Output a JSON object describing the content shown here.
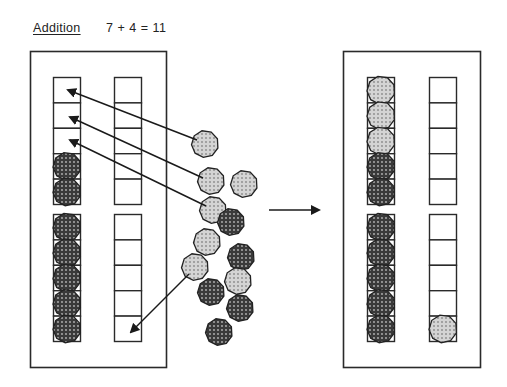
{
  "title": {
    "operation": "Addition",
    "equation": "7 + 4 = 11"
  },
  "colors": {
    "line": "#2a2a2a",
    "dark_chip_fill": "#3a3a3a",
    "dark_chip_dots": "#b8b8b8",
    "light_chip_fill": "#d4d4d4",
    "light_chip_dots": "#8a8a8a",
    "cell_fill": "#ffffff"
  },
  "diagram": {
    "left_frame": {
      "label": "before",
      "ten_frames": [
        {
          "columns": [
            {
              "cells": 5,
              "filled": [
                "",
                "",
                "",
                "dark",
                "dark"
              ]
            },
            {
              "cells": 5,
              "filled": [
                "",
                "",
                "",
                "",
                ""
              ]
            }
          ]
        },
        {
          "columns": [
            {
              "cells": 5,
              "filled": [
                "dark",
                "dark",
                "dark",
                "dark",
                "dark"
              ]
            },
            {
              "cells": 5,
              "filled": [
                "",
                "",
                "",
                "",
                ""
              ]
            }
          ]
        }
      ]
    },
    "right_frame": {
      "label": "after",
      "ten_frames": [
        {
          "columns": [
            {
              "cells": 5,
              "filled": [
                "light",
                "light",
                "light",
                "dark",
                "dark"
              ]
            },
            {
              "cells": 5,
              "filled": [
                "",
                "",
                "",
                "",
                ""
              ]
            }
          ]
        },
        {
          "columns": [
            {
              "cells": 5,
              "filled": [
                "dark",
                "dark",
                "dark",
                "dark",
                "dark"
              ]
            },
            {
              "cells": 5,
              "filled": [
                "",
                "",
                "",
                "",
                "light"
              ]
            }
          ]
        }
      ]
    },
    "loose_chips": [
      {
        "type": "light",
        "x": 205,
        "y": 144
      },
      {
        "type": "light",
        "x": 211,
        "y": 181
      },
      {
        "type": "light",
        "x": 244,
        "y": 184
      },
      {
        "type": "light",
        "x": 213,
        "y": 210
      },
      {
        "type": "dark",
        "x": 231,
        "y": 222
      },
      {
        "type": "light",
        "x": 207,
        "y": 242
      },
      {
        "type": "dark",
        "x": 241,
        "y": 257
      },
      {
        "type": "light",
        "x": 195,
        "y": 267
      },
      {
        "type": "light",
        "x": 238,
        "y": 281
      },
      {
        "type": "dark",
        "x": 211,
        "y": 292
      },
      {
        "type": "dark",
        "x": 240,
        "y": 308
      },
      {
        "type": "dark",
        "x": 219,
        "y": 332
      }
    ],
    "move_arrows": [
      {
        "from": [
          197,
          140
        ],
        "to": [
          68,
          90
        ]
      },
      {
        "from": [
          203,
          178
        ],
        "to": [
          70,
          117
        ]
      },
      {
        "from": [
          206,
          206
        ],
        "to": [
          70,
          140
        ]
      },
      {
        "from": [
          189,
          274
        ],
        "to": [
          131,
          332
        ]
      }
    ],
    "transition_arrow": {
      "from": [
        269,
        210
      ],
      "to": [
        319,
        210
      ]
    }
  }
}
